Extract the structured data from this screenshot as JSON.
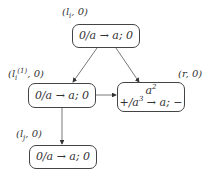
{
  "nodes": {
    "top": {
      "label_main": "l",
      "label_sub": "i",
      "label_sup": "",
      "label_tail": ", 0)",
      "content": "0/a → a; 0"
    },
    "left": {
      "label_main": "l",
      "label_sub": "i",
      "label_sup": "(1)",
      "label_tail": ", 0)",
      "content": "0/a → a; 0"
    },
    "right": {
      "label_main": "r",
      "label_sub": "",
      "label_sup": "",
      "label_tail": ", 0)",
      "content_top_base": "a",
      "content_top_sup": "2",
      "content_bottom_pre": "+/a",
      "content_bottom_sup": "3",
      "content_bottom_post": " → a; −"
    },
    "bottom": {
      "label_main": "l",
      "label_sub": "j",
      "label_sup": "",
      "label_tail": ", 0)",
      "content": "0/a → a; 0"
    }
  },
  "label_open": "(",
  "edges": [
    {
      "from": "top",
      "to": "left"
    },
    {
      "from": "top",
      "to": "right"
    },
    {
      "from": "left",
      "to": "right"
    },
    {
      "from": "left",
      "to": "bottom"
    }
  ]
}
